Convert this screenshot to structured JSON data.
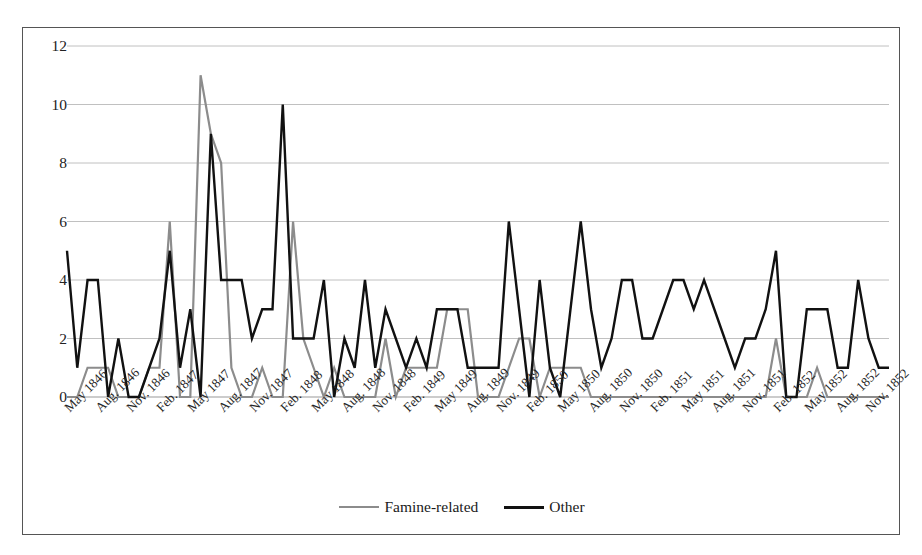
{
  "chart_data": {
    "type": "line",
    "title": "",
    "subtitle": "",
    "xlabel": "",
    "ylabel": "",
    "ylim": [
      0,
      12
    ],
    "yticks": [
      0,
      2,
      4,
      6,
      8,
      10,
      12
    ],
    "grid": "horizontal",
    "legend_position": "bottom-center",
    "x_tick_labels": [
      "May 1846",
      "Aug. 1846",
      "Nov. 1846",
      "Feb. 1847",
      "May 1847",
      "Aug. 1847",
      "Nov. 1847",
      "Feb. 1848",
      "May 1848",
      "Aug. 1848",
      "Nov. 1848",
      "Feb. 1849",
      "May 1849",
      "Aug. 1849",
      "Nov. 1849",
      "Feb. 1850",
      "May 1850",
      "Aug. 1850",
      "Nov. 1850",
      "Feb. 1851",
      "May 1851",
      "Aug. 1851",
      "Nov. 1851",
      "Feb. 1852",
      "May 1852",
      "Aug. 1852",
      "Nov. 1852"
    ],
    "x_tick_interval_months": 3,
    "x_start": "May 1846",
    "x_end": "Jan. 1853",
    "x": [
      "May 1846",
      "Jun. 1846",
      "Jul. 1846",
      "Aug. 1846",
      "Sep. 1846",
      "Oct. 1846",
      "Nov. 1846",
      "Dec. 1846",
      "Jan. 1847",
      "Feb. 1847",
      "Mar. 1847",
      "Apr. 1847",
      "May 1847",
      "Jun. 1847",
      "Jul. 1847",
      "Aug. 1847",
      "Sep. 1847",
      "Oct. 1847",
      "Nov. 1847",
      "Dec. 1847",
      "Jan. 1848",
      "Feb. 1848",
      "Mar. 1848",
      "Apr. 1848",
      "May 1848",
      "Jun. 1848",
      "Jul. 1848",
      "Aug. 1848",
      "Sep. 1848",
      "Oct. 1848",
      "Nov. 1848",
      "Dec. 1848",
      "Jan. 1849",
      "Feb. 1849",
      "Mar. 1849",
      "Apr. 1849",
      "May 1849",
      "Jun. 1849",
      "Jul. 1849",
      "Aug. 1849",
      "Sep. 1849",
      "Oct. 1849",
      "Nov. 1849",
      "Dec. 1849",
      "Jan. 1850",
      "Feb. 1850",
      "Mar. 1850",
      "Apr. 1850",
      "May 1850",
      "Jun. 1850",
      "Jul. 1850",
      "Aug. 1850",
      "Sep. 1850",
      "Oct. 1850",
      "Nov. 1850",
      "Dec. 1850",
      "Jan. 1851",
      "Feb. 1851",
      "Mar. 1851",
      "Apr. 1851",
      "May 1851",
      "Jun. 1851",
      "Jul. 1851",
      "Aug. 1851",
      "Sep. 1851",
      "Oct. 1851",
      "Nov. 1851",
      "Dec. 1851",
      "Jan. 1852",
      "Feb. 1852",
      "Mar. 1852",
      "Apr. 1852",
      "May 1852",
      "Jun. 1852",
      "Jul. 1852",
      "Aug. 1852",
      "Sep. 1852",
      "Oct. 1852",
      "Nov. 1852",
      "Dec. 1852",
      "Jan. 1853"
    ],
    "series": [
      {
        "name": "Famine-related",
        "color": "#8c8c8c",
        "values": [
          0,
          0,
          1,
          1,
          1,
          0,
          0,
          0,
          1,
          1,
          6,
          0,
          0,
          11,
          9,
          8,
          1,
          0,
          0,
          1,
          0,
          0,
          6,
          2,
          1,
          0,
          1,
          0,
          0,
          0,
          0,
          2,
          0,
          1,
          1,
          1,
          1,
          3,
          3,
          3,
          0,
          0,
          0,
          1,
          2,
          2,
          0,
          1,
          1,
          1,
          1,
          0,
          0,
          0,
          0,
          0,
          0,
          0,
          0,
          0,
          0,
          0,
          0,
          0,
          0,
          0,
          0,
          0,
          0,
          2,
          0,
          0,
          0,
          1,
          0,
          0,
          0,
          0,
          0,
          0,
          0
        ]
      },
      {
        "name": "Other",
        "color": "#111111",
        "values": [
          5,
          1,
          4,
          4,
          0,
          2,
          0,
          0,
          1,
          2,
          5,
          1,
          3,
          0,
          9,
          4,
          4,
          4,
          2,
          3,
          3,
          10,
          2,
          2,
          2,
          4,
          0,
          2,
          1,
          4,
          1,
          3,
          2,
          1,
          2,
          1,
          3,
          3,
          3,
          1,
          1,
          1,
          1,
          6,
          3,
          0,
          4,
          1,
          0,
          3,
          6,
          3,
          1,
          2,
          4,
          4,
          2,
          2,
          3,
          4,
          4,
          3,
          4,
          3,
          2,
          1,
          2,
          2,
          3,
          5,
          0,
          0,
          3,
          3,
          3,
          1,
          1,
          4,
          2,
          1,
          1
        ]
      }
    ]
  },
  "legend": {
    "items": [
      {
        "label": "Famine-related",
        "color": "#8c8c8c",
        "width": 2.5
      },
      {
        "label": "Other",
        "color": "#111111",
        "width": 3.5
      }
    ]
  }
}
